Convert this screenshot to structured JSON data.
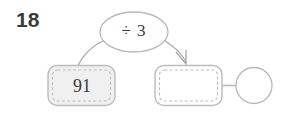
{
  "worksheet": {
    "question_number": "18",
    "operation_label": "÷ 3",
    "start_value": "91",
    "result_value": "",
    "answer_circle_value": ""
  },
  "colors": {
    "number_text": "#3b3b3b",
    "node_text": "#3a3a3a",
    "outline": "#b9b9b9",
    "dashed_inner": "#bdbdbd",
    "filled_node_bg": "#f0f0f0",
    "empty_node_bg": "#ffffff",
    "arrow": "#a6a6a6",
    "page_bg": "#ffffff"
  },
  "nodes": [
    {
      "name": "start-box",
      "value": "91",
      "filled": true
    },
    {
      "name": "result-box",
      "value": "",
      "filled": false
    },
    {
      "name": "answer-circle",
      "value": "",
      "filled": false
    }
  ],
  "flow": {
    "from": "91",
    "operation": "÷ 3",
    "to": ""
  }
}
